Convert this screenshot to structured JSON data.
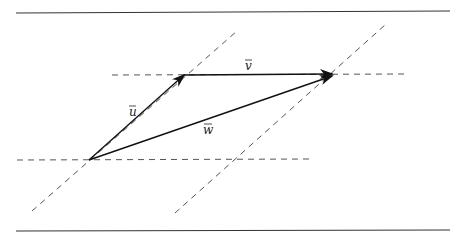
{
  "figure": {
    "labels": {
      "u": "u",
      "v": "v",
      "w": "w"
    },
    "colors": {
      "line": "#222222",
      "dashed": "#555555",
      "rule": "#333333"
    }
  }
}
